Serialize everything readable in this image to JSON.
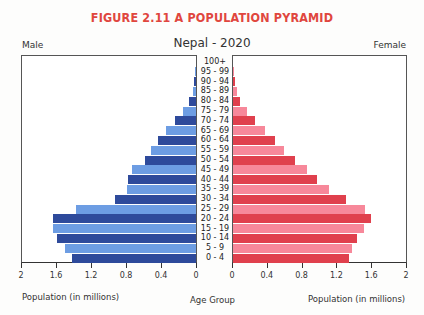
{
  "figure_title": "FIGURE 2.11 A POPULATION PYRAMID",
  "chart_title": "Nepal - 2020",
  "left_label": "Male",
  "right_label": "Female",
  "x_axis_left_title": "Population (in millions)",
  "x_axis_center_title": "Age Group",
  "x_axis_right_title": "Population (in millions)",
  "colors": {
    "title": "#e0463e",
    "male_dark": "#2e4a9b",
    "male_light": "#6d9de3",
    "female_dark": "#e0404d",
    "female_light": "#f7889a"
  },
  "chart_data": {
    "type": "bar",
    "orientation": "horizontal-pyramid",
    "title": "Nepal - 2020",
    "categories": [
      "100+",
      "95 - 99",
      "90 - 94",
      "85 - 89",
      "80 - 84",
      "75 - 79",
      "70 - 74",
      "65 - 69",
      "60 - 64",
      "55 - 59",
      "50 - 54",
      "45 - 49",
      "40 - 44",
      "35 - 39",
      "30 - 34",
      "25 - 29",
      "20 - 24",
      "15 - 19",
      "10 - 14",
      "5 - 9",
      "0 - 4"
    ],
    "series": [
      {
        "name": "Male",
        "values": [
          0.0,
          0.01,
          0.02,
          0.03,
          0.08,
          0.15,
          0.24,
          0.34,
          0.43,
          0.51,
          0.58,
          0.73,
          0.78,
          0.79,
          0.93,
          1.37,
          1.63,
          1.64,
          1.59,
          1.5,
          1.42
        ]
      },
      {
        "name": "Female",
        "values": [
          0.0,
          0.01,
          0.02,
          0.05,
          0.08,
          0.16,
          0.25,
          0.37,
          0.48,
          0.59,
          0.71,
          0.85,
          0.97,
          1.1,
          1.3,
          1.52,
          1.59,
          1.5,
          1.42,
          1.37,
          1.33
        ]
      }
    ],
    "xlabel": "Population (in millions)",
    "ylabel": "Age Group",
    "xlim": [
      0,
      2
    ],
    "x_ticks_left": [
      "2",
      "1.6",
      "1.2",
      "0.8",
      "0.4",
      "0"
    ],
    "x_ticks_right": [
      "0",
      "0.4",
      "0.8",
      "1.2",
      "1.6",
      "2"
    ],
    "grid": false,
    "legend": [
      "Male (left)",
      "Female (right)"
    ]
  }
}
